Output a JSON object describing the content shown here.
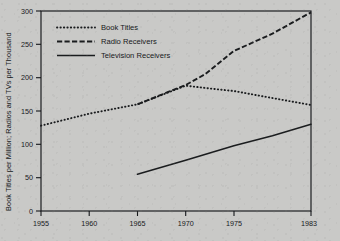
{
  "chart_data": {
    "type": "line",
    "title": "",
    "xlabel": "",
    "ylabel": "Book Titles per Million; Radios and TVs per Thousand",
    "xlim": [
      1955,
      1983
    ],
    "ylim": [
      0,
      300
    ],
    "grid": false,
    "legend_position": "upper-left-inside",
    "x_ticks": [
      "1955",
      "1960",
      "1965",
      "1970",
      "1975",
      "1983"
    ],
    "x_tick_values": [
      1955,
      1960,
      1965,
      1970,
      1975,
      1983
    ],
    "y_ticks": [
      "0",
      "50",
      "100",
      "150",
      "200",
      "250",
      "300"
    ],
    "y_tick_values": [
      0,
      50,
      100,
      150,
      200,
      250,
      300
    ],
    "series": [
      {
        "name": "Book Titles",
        "style": "dotted",
        "x": [
          1955,
          1960,
          1965,
          1970,
          1973,
          1975,
          1978,
          1983
        ],
        "values": [
          128,
          146,
          160,
          188,
          183,
          180,
          172,
          159
        ]
      },
      {
        "name": "Radio Receivers",
        "style": "dashed",
        "x": [
          1965,
          1970,
          1972,
          1975,
          1979,
          1983
        ],
        "values": [
          160,
          189,
          205,
          240,
          266,
          298
        ]
      },
      {
        "name": "Television Receivers",
        "style": "solid",
        "x": [
          1965,
          1970,
          1975,
          1979,
          1983
        ],
        "values": [
          55,
          76,
          98,
          113,
          130
        ]
      }
    ]
  },
  "legend": {
    "items": [
      {
        "label": "Book Titles",
        "style": "dotted"
      },
      {
        "label": "Radio Receivers",
        "style": "dashed"
      },
      {
        "label": "Television Receivers",
        "style": "solid"
      }
    ]
  },
  "axes": {
    "y_title": "Book Titles per Million; Radios and TVs per Thousand",
    "y_labels": [
      "300",
      "250",
      "200",
      "150",
      "100",
      "50",
      "0"
    ],
    "x_labels": [
      "1955",
      "1960",
      "1965",
      "1970",
      "1975",
      "1983"
    ]
  }
}
